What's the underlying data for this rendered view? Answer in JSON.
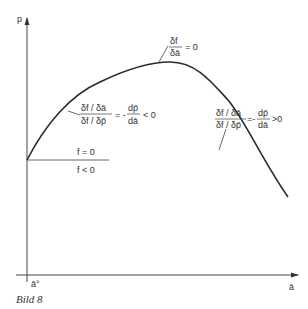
{
  "figure": {
    "caption": "Bild 8",
    "y_axis_label": "p",
    "x_axis_label": "ā",
    "x_origin_label": "ā°"
  },
  "region_labels": {
    "upper": "f = 0",
    "lower": "f < 0"
  },
  "annotations": {
    "peak": {
      "numerator": "δf",
      "denominator": "δā",
      "rhs": "= 0"
    },
    "rising": {
      "numerator": "δf / δā",
      "denominator": "δf / δp̄",
      "eq": "= -",
      "deriv_num": "dp̄",
      "deriv_den": "dā",
      "rhs": "< 0"
    },
    "falling": {
      "numerator": "δf / δā",
      "denominator": "δf / δp̄",
      "eq": "=-",
      "deriv_num": "dp̄",
      "deriv_den": "dā",
      "rhs": ">0"
    }
  }
}
